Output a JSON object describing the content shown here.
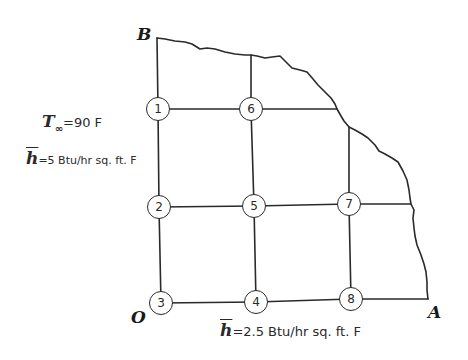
{
  "diagram": {
    "corners": {
      "B": "B",
      "O": "O",
      "A": "A"
    },
    "nodes": [
      {
        "id": "1",
        "x": 158,
        "y": 109
      },
      {
        "id": "2",
        "x": 159,
        "y": 207
      },
      {
        "id": "3",
        "x": 161,
        "y": 303
      },
      {
        "id": "4",
        "x": 256,
        "y": 302
      },
      {
        "id": "5",
        "x": 254,
        "y": 206
      },
      {
        "id": "6",
        "x": 251,
        "y": 109
      },
      {
        "id": "7",
        "x": 349,
        "y": 204
      },
      {
        "id": "8",
        "x": 351,
        "y": 299
      }
    ],
    "left_boundary": {
      "t_symbol": "T",
      "t_subscript": "∞",
      "t_value": "=90 F",
      "h_symbol": "h",
      "h_value": "=5 Btu/hr sq. ft. F"
    },
    "bottom_boundary": {
      "h_symbol": "h",
      "h_value": "=2.5 Btu/hr sq. ft. F"
    },
    "colors": {
      "line": "#2a2a2a",
      "background": "#ffffff"
    }
  }
}
